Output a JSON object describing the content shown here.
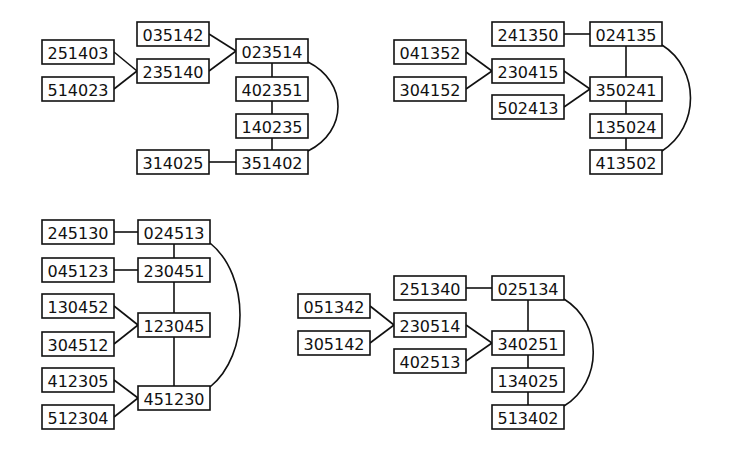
{
  "diagram": {
    "style": {
      "stroke": "#111111",
      "background": "#ffffff",
      "node_fill": "#ffffff"
    },
    "node_size": {
      "w": 72,
      "h": 24
    },
    "graphs": [
      {
        "id": "g1",
        "nodes": [
          {
            "id": "035142",
            "label": "035142",
            "x": 137,
            "y": 22
          },
          {
            "id": "023514",
            "label": "023514",
            "x": 236,
            "y": 39
          },
          {
            "id": "251403",
            "label": "251403",
            "x": 42,
            "y": 40
          },
          {
            "id": "235140",
            "label": "235140",
            "x": 137,
            "y": 59
          },
          {
            "id": "514023",
            "label": "514023",
            "x": 42,
            "y": 77
          },
          {
            "id": "402351",
            "label": "402351",
            "x": 236,
            "y": 77
          },
          {
            "id": "140235",
            "label": "140235",
            "x": 236,
            "y": 114
          },
          {
            "id": "314025",
            "label": "314025",
            "x": 137,
            "y": 150
          },
          {
            "id": "351402",
            "label": "351402",
            "x": 236,
            "y": 150
          }
        ],
        "edges": [
          [
            "035142",
            "023514"
          ],
          [
            "235140",
            "023514"
          ],
          [
            "251403",
            "235140"
          ],
          [
            "514023",
            "235140"
          ],
          [
            "023514",
            "402351"
          ],
          [
            "402351",
            "140235"
          ],
          [
            "140235",
            "351402"
          ],
          [
            "314025",
            "351402"
          ]
        ],
        "arcs": [
          {
            "from": "023514",
            "to": "351402",
            "bulge_x": 348
          }
        ]
      },
      {
        "id": "g2",
        "nodes": [
          {
            "id": "241350",
            "label": "241350",
            "x": 492,
            "y": 22
          },
          {
            "id": "024135",
            "label": "024135",
            "x": 590,
            "y": 22
          },
          {
            "id": "041352",
            "label": "041352",
            "x": 394,
            "y": 40
          },
          {
            "id": "230415",
            "label": "230415",
            "x": 492,
            "y": 59
          },
          {
            "id": "304152",
            "label": "304152",
            "x": 394,
            "y": 77
          },
          {
            "id": "350241",
            "label": "350241",
            "x": 590,
            "y": 77
          },
          {
            "id": "502413",
            "label": "502413",
            "x": 492,
            "y": 95
          },
          {
            "id": "135024",
            "label": "135024",
            "x": 590,
            "y": 114
          },
          {
            "id": "413502",
            "label": "413502",
            "x": 590,
            "y": 150
          }
        ],
        "edges": [
          [
            "241350",
            "024135"
          ],
          [
            "041352",
            "230415"
          ],
          [
            "304152",
            "230415"
          ],
          [
            "230415",
            "350241"
          ],
          [
            "502413",
            "350241"
          ],
          [
            "024135",
            "350241"
          ],
          [
            "350241",
            "135024"
          ],
          [
            "135024",
            "413502"
          ]
        ],
        "arcs": [
          {
            "from": "024135",
            "to": "413502",
            "bulge_x": 700
          }
        ]
      },
      {
        "id": "g3",
        "nodes": [
          {
            "id": "245130",
            "label": "245130",
            "x": 42,
            "y": 220
          },
          {
            "id": "024513",
            "label": "024513",
            "x": 138,
            "y": 220
          },
          {
            "id": "045123",
            "label": "045123",
            "x": 42,
            "y": 258
          },
          {
            "id": "230451",
            "label": "230451",
            "x": 138,
            "y": 258
          },
          {
            "id": "130452",
            "label": "130452",
            "x": 42,
            "y": 294
          },
          {
            "id": "123045",
            "label": "123045",
            "x": 138,
            "y": 313
          },
          {
            "id": "304512",
            "label": "304512",
            "x": 42,
            "y": 332
          },
          {
            "id": "412305",
            "label": "412305",
            "x": 42,
            "y": 368
          },
          {
            "id": "451230",
            "label": "451230",
            "x": 138,
            "y": 386
          },
          {
            "id": "512304",
            "label": "512304",
            "x": 42,
            "y": 405
          }
        ],
        "edges": [
          [
            "245130",
            "024513"
          ],
          [
            "045123",
            "230451"
          ],
          [
            "024513",
            "230451"
          ],
          [
            "230451",
            "123045"
          ],
          [
            "123045",
            "451230"
          ],
          [
            "130452",
            "123045"
          ],
          [
            "304512",
            "123045"
          ],
          [
            "412305",
            "451230"
          ],
          [
            "512304",
            "451230"
          ]
        ],
        "arcs": [
          {
            "from": "024513",
            "to": "451230",
            "bulge_x": 250
          }
        ]
      },
      {
        "id": "g4",
        "nodes": [
          {
            "id": "251340",
            "label": "251340",
            "x": 394,
            "y": 276
          },
          {
            "id": "025134",
            "label": "025134",
            "x": 492,
            "y": 276
          },
          {
            "id": "051342",
            "label": "051342",
            "x": 298,
            "y": 294
          },
          {
            "id": "230514",
            "label": "230514",
            "x": 394,
            "y": 313
          },
          {
            "id": "305142",
            "label": "305142",
            "x": 298,
            "y": 331
          },
          {
            "id": "340251",
            "label": "340251",
            "x": 492,
            "y": 331
          },
          {
            "id": "402513",
            "label": "402513",
            "x": 394,
            "y": 349
          },
          {
            "id": "134025",
            "label": "134025",
            "x": 492,
            "y": 368
          },
          {
            "id": "513402",
            "label": "513402",
            "x": 492,
            "y": 405
          }
        ],
        "edges": [
          [
            "251340",
            "025134"
          ],
          [
            "051342",
            "230514"
          ],
          [
            "305142",
            "230514"
          ],
          [
            "230514",
            "340251"
          ],
          [
            "402513",
            "340251"
          ],
          [
            "025134",
            "340251"
          ],
          [
            "340251",
            "134025"
          ],
          [
            "134025",
            "513402"
          ]
        ],
        "arcs": [
          {
            "from": "025134",
            "to": "513402",
            "bulge_x": 603
          }
        ]
      }
    ]
  }
}
